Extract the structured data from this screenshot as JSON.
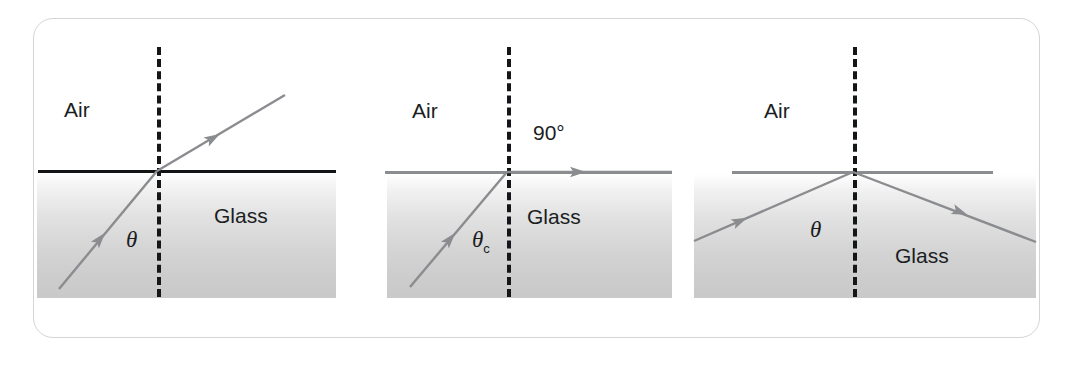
{
  "figure": {
    "border_color": "#d2d4d6",
    "ray_color": "#8a8c8f",
    "normal_color": "#141618",
    "interface_dark_color": "#111315",
    "glass_top_color": "#ffffff",
    "glass_bottom_color": "#c9c9c9",
    "text_color": "#1b1d1f"
  },
  "panels": [
    {
      "id": "panel-refraction",
      "name": "refraction-below-critical-angle",
      "labels": {
        "medium_upper": "Air",
        "medium_lower": "Glass",
        "angle": "θ",
        "angle_subscript": "",
        "extra": ""
      },
      "rays": {
        "incident": {
          "from": [
            59,
            289
          ],
          "to": [
            157,
            171
          ],
          "arrow_at": [
            100,
            239
          ]
        },
        "refracted": {
          "from": [
            157,
            171
          ],
          "to": [
            285,
            95
          ],
          "arrow_at": [
            213,
            138
          ]
        }
      },
      "interface": {
        "x1": 38,
        "x2": 336,
        "y": 171,
        "style": "dark"
      },
      "normal": {
        "x": 157,
        "y1": 47,
        "y2": 297
      },
      "glass": {
        "x": 37,
        "y": 173,
        "width": 299,
        "height": 125
      }
    },
    {
      "id": "panel-critical-angle",
      "name": "critical-angle-ninety-degree-refraction",
      "labels": {
        "medium_upper": "Air",
        "medium_lower": "Glass",
        "angle": "θ",
        "angle_subscript": "c",
        "extra": "90°"
      },
      "rays": {
        "incident": {
          "from": [
            410,
            287
          ],
          "to": [
            507,
            172
          ],
          "arrow_at": [
            450,
            239
          ]
        },
        "refracted": {
          "from": [
            507,
            172
          ],
          "to": [
            672,
            172
          ],
          "arrow_at": [
            578,
            172
          ]
        }
      },
      "interface": {
        "x1": 385,
        "x2": 672,
        "y": 172,
        "style": "gray"
      },
      "normal": {
        "x": 507,
        "y1": 47,
        "y2": 297
      },
      "glass": {
        "x": 387,
        "y": 174,
        "width": 285,
        "height": 124
      }
    },
    {
      "id": "panel-total-internal-reflection",
      "name": "total-internal-reflection",
      "labels": {
        "medium_upper": "Air",
        "medium_lower": "Glass",
        "angle": "θ",
        "angle_subscript": "",
        "extra": ""
      },
      "rays": {
        "incident": {
          "from": [
            694,
            241
          ],
          "to": [
            853,
            172
          ],
          "arrow_at": [
            740,
            221
          ]
        },
        "reflected": {
          "from": [
            853,
            172
          ],
          "to": [
            1036,
            242
          ],
          "arrow_at": [
            960,
            212
          ]
        }
      },
      "interface": {
        "x1": 732,
        "x2": 993,
        "y": 172,
        "style": "gray"
      },
      "normal": {
        "x": 853,
        "y1": 47,
        "y2": 297
      },
      "glass": {
        "x": 694,
        "y": 174,
        "width": 342,
        "height": 124
      }
    }
  ],
  "text_positions": {
    "panel1_air": [
      64,
      99
    ],
    "panel1_glass": [
      214,
      205
    ],
    "panel1_angle": [
      126,
      228
    ],
    "panel2_air": [
      412,
      100
    ],
    "panel2_ninety": [
      533,
      122
    ],
    "panel2_glass": [
      527,
      206
    ],
    "panel2_angle": [
      472,
      228
    ],
    "panel3_air": [
      764,
      100
    ],
    "panel3_glass": [
      895,
      245
    ],
    "panel3_angle": [
      810,
      218
    ]
  }
}
